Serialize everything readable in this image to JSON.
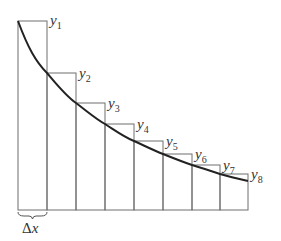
{
  "diagram": {
    "title": "",
    "colors": {
      "rect_stroke": "#6e6e6e",
      "curve": "#222222",
      "text": "#333333",
      "background": "#ffffff"
    },
    "labels": [
      {
        "var": "y",
        "sub": "1"
      },
      {
        "var": "y",
        "sub": "2"
      },
      {
        "var": "y",
        "sub": "3"
      },
      {
        "var": "y",
        "sub": "4"
      },
      {
        "var": "y",
        "sub": "5"
      },
      {
        "var": "y",
        "sub": "6"
      },
      {
        "var": "y",
        "sub": "7"
      },
      {
        "var": "y",
        "sub": "8"
      }
    ],
    "width_label": {
      "symbol": "Δ",
      "var": "x"
    }
  }
}
